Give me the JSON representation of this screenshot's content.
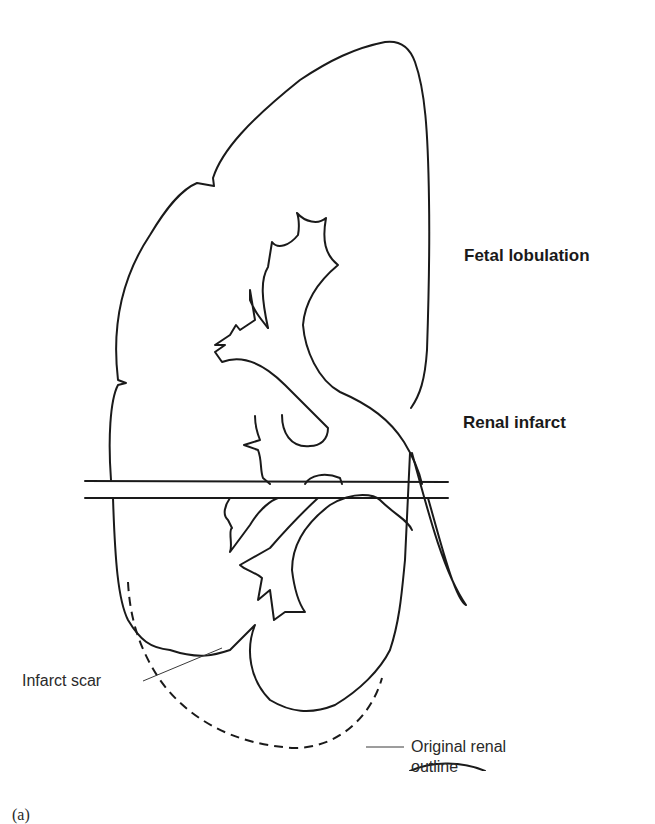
{
  "figure": {
    "panel_label": "(a)",
    "labels": {
      "fetal_lobulation": "Fetal lobulation",
      "renal_infarct": "Renal infarct",
      "infarct_scar": "Infarct scar",
      "original_outline_line1": "Original renal",
      "original_outline_line2": "outline"
    },
    "colors": {
      "line": "#1a1a1a",
      "background": "#ffffff"
    }
  }
}
